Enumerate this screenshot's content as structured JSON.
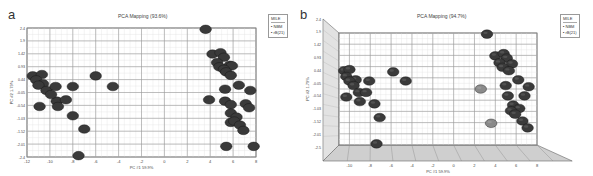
{
  "panels": [
    {
      "letter": "a",
      "title": "PCA Mapping (93.6%)",
      "legend": {
        "title": "MILE",
        "entries": [
          "NBM",
          "rB(21)"
        ]
      },
      "xlabel": "PC #1 59.9%",
      "ylabel": "PC #2 1.79%"
    },
    {
      "letter": "b",
      "title": "PCA Mapping (94.7%)",
      "legend": {
        "title": "MILE",
        "entries": [
          "NBM",
          "rB(21)"
        ]
      },
      "xlabel": "PC #1 59.9%",
      "ylabel": "PC #2 1.79%"
    }
  ],
  "chart_data": [
    {
      "type": "scatter",
      "title": "PCA Mapping (93.6%)",
      "panel": "a",
      "xlabel": "PC #1 59.9%",
      "ylabel": "PC #2 1.79%",
      "xlim": [
        -12,
        8
      ],
      "ylim": [
        -2.45,
        2.4
      ],
      "xticks": [
        -12,
        -10,
        -8,
        -6,
        -4,
        -2,
        0,
        2,
        4,
        6,
        8
      ],
      "yticks": [
        "2.4",
        "1.9",
        "1.42",
        "0.93",
        "0.44",
        "-0.05",
        "-0.54",
        "-1.03",
        "-1.52",
        "-2.01",
        "-2.4"
      ],
      "grid": true,
      "legend": {
        "title": "MILE",
        "entries": [
          "NBM",
          "rB(21)"
        ],
        "position": "top-right-outside"
      },
      "series": [
        {
          "name": "NBM",
          "color": "#3a3a3a",
          "points": [
            [
              3.6,
              2.35
            ],
            [
              4.2,
              1.42
            ],
            [
              4.9,
              1.47
            ],
            [
              5.2,
              1.3
            ],
            [
              4.6,
              1.1
            ],
            [
              5.7,
              1.0
            ],
            [
              5.9,
              0.98
            ],
            [
              4.8,
              0.94
            ],
            [
              5.2,
              0.85
            ],
            [
              5.4,
              0.75
            ],
            [
              5.8,
              0.62
            ],
            [
              6.5,
              0.25
            ],
            [
              7.5,
              0.05
            ],
            [
              5.3,
              0.1
            ],
            [
              3.9,
              -0.3
            ],
            [
              5.3,
              -0.35
            ],
            [
              5.8,
              -0.48
            ],
            [
              7.1,
              -0.45
            ],
            [
              7.4,
              -0.6
            ],
            [
              5.8,
              -0.8
            ],
            [
              6.3,
              -0.95
            ],
            [
              5.8,
              -1.15
            ],
            [
              6.1,
              -1.1
            ],
            [
              6.6,
              -1.25
            ],
            [
              6.9,
              -1.45
            ],
            [
              5.4,
              -2.05
            ],
            [
              7.8,
              -2.05
            ],
            [
              -11.5,
              0.6
            ],
            [
              -10.7,
              0.65
            ],
            [
              -11.2,
              0.45
            ],
            [
              -10.6,
              0.3
            ],
            [
              -11.0,
              0.25
            ],
            [
              -10.3,
              0.05
            ],
            [
              -9.5,
              0.2
            ],
            [
              -8.0,
              0.2
            ],
            [
              -9.4,
              -0.35
            ],
            [
              -8.6,
              -0.3
            ],
            [
              -10.9,
              -0.55
            ],
            [
              -9.3,
              -0.55
            ],
            [
              -8.0,
              -0.9
            ],
            [
              -6.0,
              0.6
            ],
            [
              -4.5,
              0.2
            ],
            [
              -7.0,
              -1.4
            ],
            [
              -7.5,
              -2.4
            ],
            [
              -9.9,
              -0.1
            ]
          ]
        },
        {
          "name": "rB(21)",
          "color": "#222222",
          "points": []
        }
      ]
    },
    {
      "type": "scatter",
      "title": "PCA Mapping (94.7%)",
      "panel": "b",
      "xlabel": "PC #1 59.9%",
      "ylabel": "PC #2 1.79%",
      "style": "3d-box",
      "xlim": [
        -11,
        8
      ],
      "ylim": [
        -2.5,
        2.4
      ],
      "xticks": [
        -10,
        -8,
        -6,
        -4,
        -2,
        0,
        2,
        4,
        6,
        8
      ],
      "yticks": [
        "2.4",
        "1.9",
        "1.42",
        "0.93",
        "0.44",
        "-0.05",
        "-0.54",
        "-1.03",
        "-1.52",
        "-2.01",
        "-2.5"
      ],
      "grid": true,
      "legend": {
        "title": "MILE",
        "entries": [
          "NBM",
          "rB(21)"
        ],
        "position": "top-right-outside"
      },
      "series": [
        {
          "name": "NBM",
          "color": "#3a3a3a",
          "points": [
            [
              3.2,
              2.35
            ],
            [
              4.0,
              1.4
            ],
            [
              4.8,
              1.5
            ],
            [
              5.1,
              1.3
            ],
            [
              4.4,
              1.1
            ],
            [
              5.6,
              1.05
            ],
            [
              4.7,
              0.9
            ],
            [
              5.3,
              0.75
            ],
            [
              6.2,
              0.35
            ],
            [
              7.2,
              0.05
            ],
            [
              5.0,
              0.1
            ],
            [
              5.2,
              -0.35
            ],
            [
              6.8,
              -0.35
            ],
            [
              5.7,
              -0.75
            ],
            [
              6.3,
              -0.9
            ],
            [
              5.5,
              -1.0
            ],
            [
              5.9,
              -1.15
            ],
            [
              6.6,
              -1.45
            ],
            [
              7.1,
              -1.75
            ],
            [
              -10.5,
              0.75
            ],
            [
              -10.0,
              0.8
            ],
            [
              -10.3,
              0.5
            ],
            [
              -9.4,
              0.35
            ],
            [
              -10.0,
              0.3
            ],
            [
              -9.6,
              0.1
            ],
            [
              -8.1,
              0.3
            ],
            [
              -9.1,
              -0.2
            ],
            [
              -8.4,
              -0.2
            ],
            [
              -10.3,
              -0.4
            ],
            [
              -9.0,
              -0.6
            ],
            [
              -7.6,
              -0.7
            ],
            [
              -5.8,
              0.7
            ],
            [
              -4.6,
              0.3
            ],
            [
              -7.1,
              -1.3
            ],
            [
              -7.4,
              -2.45
            ]
          ]
        },
        {
          "name": "rB(21)",
          "color": "#8a8a8a",
          "points": [
            [
              2.6,
              -0.05
            ],
            [
              3.6,
              -1.55
            ]
          ]
        }
      ]
    }
  ]
}
